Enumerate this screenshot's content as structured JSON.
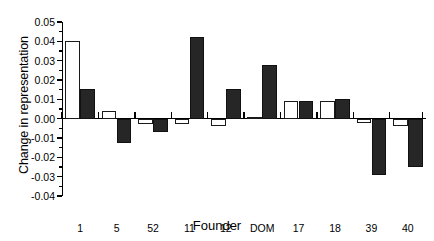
{
  "chart_data": {
    "type": "bar",
    "title": "",
    "xlabel": "Founder",
    "ylabel": "Change in representation",
    "categories": [
      "1",
      "5",
      "52",
      "11",
      "12",
      "DOM",
      "17",
      "18",
      "39",
      "40"
    ],
    "series": [
      {
        "name": "open",
        "style": "white-filled-bar",
        "values": [
          0.04,
          0.004,
          -0.003,
          -0.003,
          -0.004,
          0.0005,
          0.009,
          0.009,
          -0.002,
          -0.004
        ]
      },
      {
        "name": "filled",
        "style": "black-filled-bar",
        "values": [
          0.0155,
          -0.0125,
          -0.007,
          0.042,
          0.0155,
          0.028,
          0.009,
          0.01,
          -0.029,
          -0.025
        ]
      }
    ],
    "ylim": [
      -0.04,
      0.05
    ],
    "ytick_labels": [
      "0.05",
      "0.04",
      "0.03",
      "0.02",
      "0.01",
      "0.00",
      "-0.01",
      "-0.02",
      "-0.03",
      "-0.04"
    ],
    "ytick_values": [
      0.05,
      0.04,
      0.03,
      0.02,
      0.01,
      0.0,
      -0.01,
      -0.02,
      -0.03,
      -0.04
    ],
    "ytick_minor_step": 0.005,
    "grid": false,
    "legend_position": "none",
    "colors": {
      "open_bar_fill": "#ffffff",
      "open_bar_edge": "#1a1a1a",
      "filled_bar_fill": "#262626",
      "axis": "#000000",
      "background": "#ffffff"
    }
  }
}
